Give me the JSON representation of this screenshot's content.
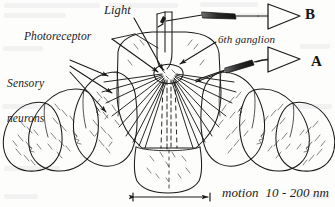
{
  "figure": {
    "background_color": "#fdfdfc",
    "ink_color": "#1b1b1b",
    "labels": {
      "light": "Light",
      "photoreceptor": "Photoreceptor",
      "sensory_neurons_line1": "Sensory",
      "sensory_neurons_line2": "neurons",
      "sixth_ganglion": "6th ganglion",
      "motion_scale": "motion  10 - 200 nm"
    },
    "amplifiers": [
      {
        "id": "amp-b",
        "letter": "B"
      },
      {
        "id": "amp-a",
        "letter": "A"
      }
    ],
    "icons": {
      "amplifier": "amplifier-triangle-icon",
      "electrode": "microelectrode-icon",
      "scale_bar": "double-arrow-scale-bar-icon",
      "leader_arrow": "leader-arrow-icon"
    }
  }
}
